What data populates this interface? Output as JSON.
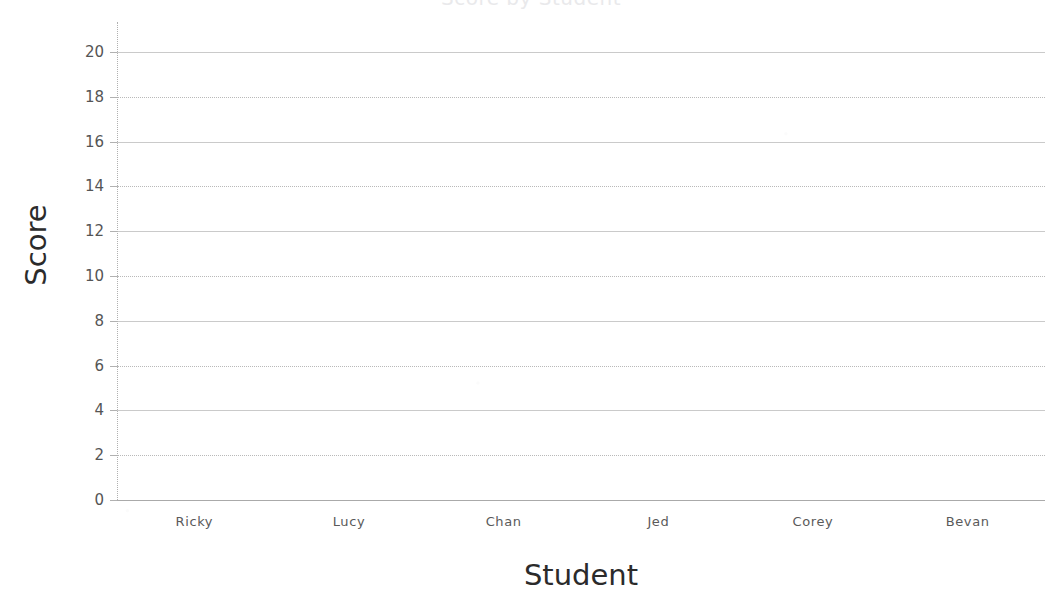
{
  "chart_data": {
    "type": "bar",
    "title": "Score by Student",
    "xlabel": "Student",
    "ylabel": "Score",
    "categories": [
      "Ricky",
      "Lucy",
      "Chan",
      "Jed",
      "Corey",
      "Bevan"
    ],
    "series": [
      {
        "name": "Score",
        "values": [
          null,
          null,
          null,
          null,
          null,
          null
        ]
      }
    ],
    "values": [
      null,
      null,
      null,
      null,
      null,
      null
    ],
    "ylim": [
      0,
      20
    ],
    "ytick_step": 2,
    "yticks": [
      "0",
      "2",
      "4",
      "6",
      "8",
      "10",
      "12",
      "14",
      "16",
      "18",
      "20"
    ],
    "grid": true,
    "grid_axis": "y",
    "legend": false,
    "legend_position": "none",
    "plot_empty": true
  },
  "chart": {
    "title": "Score by Student",
    "title_truncated": true,
    "y_axis": {
      "label": "Score",
      "ticks": [
        "0",
        "2",
        "4",
        "6",
        "8",
        "10",
        "12",
        "14",
        "16",
        "18",
        "20"
      ],
      "min": "0",
      "max": "20"
    },
    "x_axis": {
      "label": "Student",
      "categories": [
        "Ricky",
        "Lucy",
        "Chan",
        "Jed",
        "Corey",
        "Bevan"
      ]
    }
  },
  "colors": {
    "background": "#ffffff",
    "gridline": "#adadad",
    "axis_line": "#9b9b9b",
    "tick_text": "#555555",
    "axis_title_text": "#2b2b2b"
  }
}
